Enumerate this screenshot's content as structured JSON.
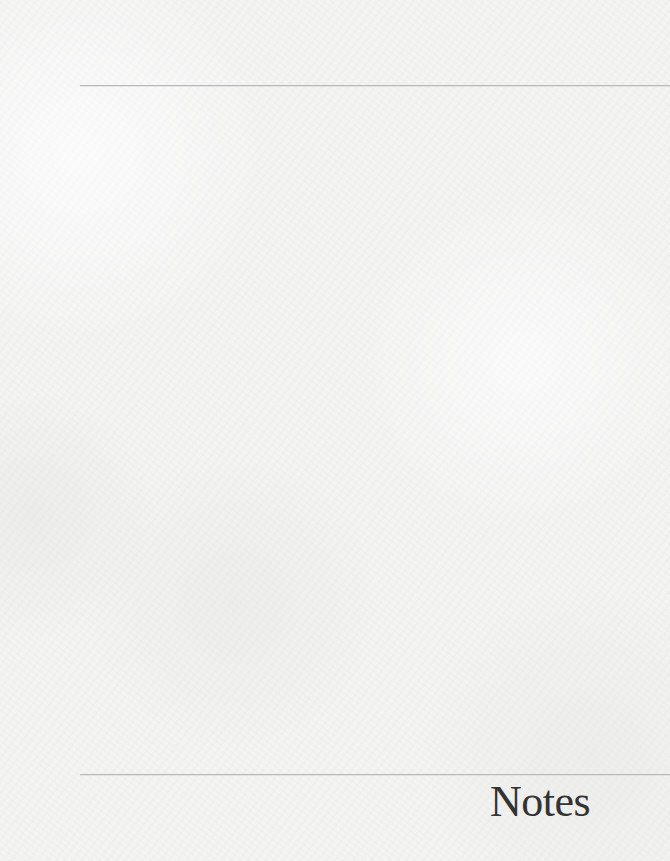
{
  "page": {
    "title": "Notes",
    "colors": {
      "background": "#f4f4f3",
      "rule": "#b9b9b9",
      "title_text": "#333333"
    }
  }
}
